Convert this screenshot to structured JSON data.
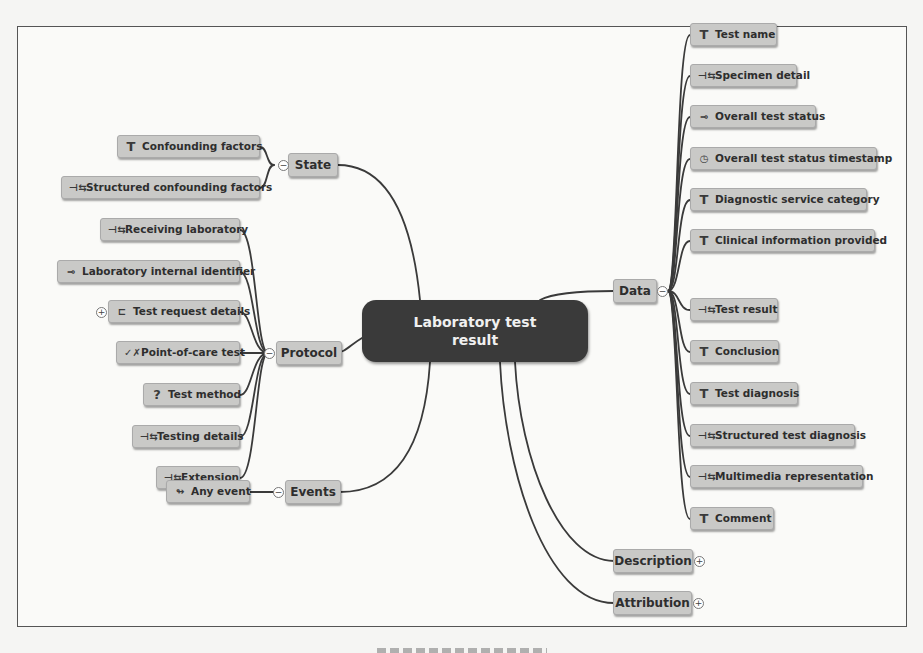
{
  "diagram": {
    "type": "mind-map",
    "root": {
      "label": "Laboratory test result"
    },
    "colors": {
      "root_fill": "#3a3a3a",
      "root_text": "#f0f0f0",
      "node_fill": "#c9c9c7",
      "node_text": "#2e2e2e",
      "link": "#3a3a3a",
      "frame": "#555555",
      "background": "#fafaf8"
    },
    "branches": {
      "state": {
        "label": "State",
        "toggle": "−",
        "children": [
          {
            "label": "Confounding factors",
            "icon": "text-icon",
            "glyph": "T"
          },
          {
            "label": "Structured confounding factors",
            "icon": "cluster-icon",
            "glyph": "⊣⇆"
          }
        ]
      },
      "protocol": {
        "label": "Protocol",
        "toggle": "−",
        "children": [
          {
            "label": "Receiving laboratory",
            "icon": "cluster-icon",
            "glyph": "⊣⇆"
          },
          {
            "label": "Laboratory internal identifier",
            "icon": "identifier-icon",
            "glyph": "⊸"
          },
          {
            "label": "Test request details",
            "icon": "cluster-icon",
            "glyph": "⊏",
            "toggle": "+"
          },
          {
            "label": "Point-of-care test",
            "icon": "boolean-icon",
            "glyph": "✓✗"
          },
          {
            "label": "Test method",
            "icon": "any-type-icon",
            "glyph": "?"
          },
          {
            "label": "Testing details",
            "icon": "cluster-icon",
            "glyph": "⊣⇆"
          },
          {
            "label": "Extension",
            "icon": "cluster-icon",
            "glyph": "⊣⇆"
          }
        ]
      },
      "events": {
        "label": "Events",
        "toggle": "−",
        "children": [
          {
            "label": "Any event",
            "icon": "event-icon",
            "glyph": "↬"
          }
        ]
      },
      "data": {
        "label": "Data",
        "toggle": "−",
        "children": [
          {
            "label": "Test name",
            "icon": "text-icon",
            "glyph": "T"
          },
          {
            "label": "Specimen detail",
            "icon": "cluster-icon",
            "glyph": "⊣⇆"
          },
          {
            "label": "Overall test status",
            "icon": "coded-text-icon",
            "glyph": "⊸"
          },
          {
            "label": "Overall test status timestamp",
            "icon": "datetime-icon",
            "glyph": "◷"
          },
          {
            "label": "Diagnostic service category",
            "icon": "text-icon",
            "glyph": "T"
          },
          {
            "label": "Clinical information provided",
            "icon": "text-icon",
            "glyph": "T"
          },
          {
            "label": "Test result",
            "icon": "cluster-icon",
            "glyph": "⊣⇆"
          },
          {
            "label": "Conclusion",
            "icon": "text-icon",
            "glyph": "T"
          },
          {
            "label": "Test diagnosis",
            "icon": "text-icon",
            "glyph": "T"
          },
          {
            "label": "Structured test diagnosis",
            "icon": "cluster-icon",
            "glyph": "⊣⇆"
          },
          {
            "label": "Multimedia representation",
            "icon": "cluster-icon",
            "glyph": "⊣⇆"
          },
          {
            "label": "Comment",
            "icon": "text-icon",
            "glyph": "T"
          }
        ]
      },
      "description": {
        "label": "Description",
        "toggle": "+"
      },
      "attribution": {
        "label": "Attribution",
        "toggle": "+"
      }
    }
  }
}
